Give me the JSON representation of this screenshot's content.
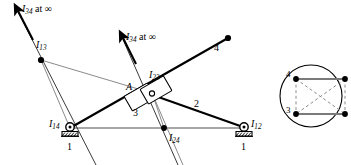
{
  "figure": {
    "background_color": "#ffffff",
    "stroke_color": "#000000",
    "construction_line_color": "#808080",
    "dashed_line_color": "#8c8c8c",
    "width": 351,
    "height": 165
  },
  "mechanism": {
    "labels": {
      "i34_top_left": {
        "base": "I",
        "sub": "34",
        "suffix": " at ∞",
        "x": 22,
        "y": 4
      },
      "i34_middle": {
        "base": "I",
        "sub": "34",
        "suffix": " at ∞",
        "x": 126,
        "y": 32
      },
      "i13": {
        "base": "I",
        "sub": "13",
        "x": 36,
        "y": 40
      },
      "i23": {
        "base": "I",
        "sub": "23",
        "x": 149,
        "y": 70
      },
      "i14": {
        "base": "I",
        "sub": "14",
        "x": 49,
        "y": 121
      },
      "i12": {
        "base": "I",
        "sub": "12",
        "x": 245,
        "y": 121
      },
      "i24": {
        "base": "I",
        "sub": "24",
        "x": 170,
        "y": 136
      },
      "point_a": {
        "base": "A",
        "x": 128,
        "y": 84
      },
      "link_2": {
        "base": "2",
        "x": 194,
        "y": 101
      },
      "link_3": {
        "base": "3",
        "x": 134,
        "y": 109
      },
      "link_4": {
        "base": "4",
        "x": 216,
        "y": 44
      },
      "ground_left_1": {
        "base": "1",
        "x": 65,
        "y": 148
      },
      "ground_right_1": {
        "base": "1",
        "x": 245,
        "y": 148
      }
    },
    "joints": {
      "i14_pivot": {
        "x": 70,
        "y": 128,
        "type": "grounded-pin"
      },
      "i12_pivot": {
        "x": 244,
        "y": 128,
        "type": "grounded-pin"
      },
      "i13_node": {
        "x": 41,
        "y": 60,
        "type": "instant-center-dot"
      },
      "i24_node": {
        "x": 164,
        "y": 128,
        "type": "instant-center-dot"
      },
      "i23_node": {
        "x": 152,
        "y": 94,
        "type": "slider-pin"
      },
      "link4_tip": {
        "x": 228,
        "y": 38,
        "type": "end-dot"
      }
    },
    "sliders": [
      {
        "name": "slider-block-a",
        "cx": 140,
        "cy": 97,
        "w": 27,
        "h": 17,
        "angle": -30
      },
      {
        "name": "slider-block-i23",
        "cx": 156,
        "cy": 90,
        "w": 27,
        "h": 17,
        "angle": -30
      }
    ]
  },
  "kennedy_circle": {
    "center": {
      "x": 311,
      "y": 96
    },
    "radius": 31,
    "vertices": [
      {
        "label": "4",
        "x": 296,
        "y": 79,
        "label_x": 283,
        "label_y": 71
      },
      {
        "label": "",
        "x": 345,
        "y": 79,
        "label_x": 349,
        "label_y": 71
      },
      {
        "label": "3",
        "x": 296,
        "y": 114,
        "label_x": 283,
        "label_y": 107
      },
      {
        "label": "",
        "x": 345,
        "y": 114,
        "label_x": 349,
        "label_y": 107
      }
    ],
    "solid_edges": [
      {
        "from": 0,
        "to": 1
      },
      {
        "from": 2,
        "to": 3
      }
    ],
    "dashed_edges": [
      {
        "from": 0,
        "to": 2
      },
      {
        "from": 0,
        "to": 3
      },
      {
        "from": 1,
        "to": 2
      },
      {
        "from": 1,
        "to": 3
      }
    ]
  }
}
